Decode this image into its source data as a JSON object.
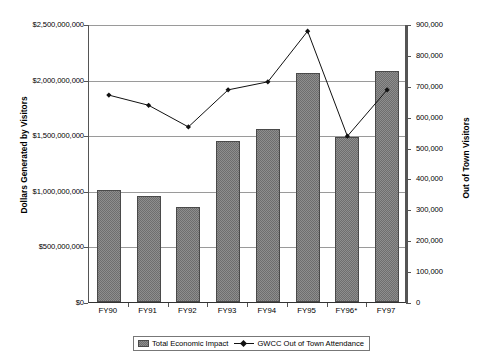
{
  "chart_data": {
    "type": "bar",
    "title": "",
    "categories": [
      "FY90",
      "FY91",
      "FY92",
      "FY93",
      "FY94",
      "FY95",
      "FY96*",
      "FY97"
    ],
    "xlabel": "",
    "series": [
      {
        "name": "Total Economic Impact",
        "type": "bar",
        "axis": "left",
        "values": [
          1010000000,
          955000000,
          850000000,
          1450000000,
          1560000000,
          2060000000,
          1480000000,
          2080000000
        ]
      },
      {
        "name": "GWCC Out of Town Attendance",
        "type": "line",
        "axis": "right",
        "values": [
          673000,
          640000,
          570000,
          690000,
          716000,
          880000,
          540000,
          690000
        ]
      }
    ],
    "left_axis": {
      "label": "Dollars Generated by Visitors",
      "ylim": [
        0,
        2500000000
      ],
      "tick_step": 500000000,
      "ticks": [
        "$0",
        "$500,000,000",
        "$1,000,000,000",
        "$1,500,000,000",
        "$2,000,000,000",
        "$2,500,000,000"
      ],
      "tick_values": [
        0,
        500000000,
        1000000000,
        1500000000,
        2000000000,
        2500000000
      ]
    },
    "right_axis": {
      "label": "Out of Town Visitors",
      "ylim": [
        0,
        900000
      ],
      "tick_step": 100000,
      "ticks": [
        "0",
        "100,000",
        "200,000",
        "300,000",
        "400,000",
        "500,000",
        "600,000",
        "700,000",
        "800,000",
        "900,000"
      ],
      "tick_values": [
        0,
        100000,
        200000,
        300000,
        400000,
        500000,
        600000,
        700000,
        800000,
        900000
      ]
    },
    "grid": true,
    "legend_position": "bottom",
    "legend": [
      "Total Economic Impact",
      "GWCC Out of Town Attendance"
    ],
    "colors": {
      "bar_fill": "#8e8e8e",
      "bar_border": "#4a4a4a",
      "line": "#111111",
      "grid": "#9a9a9a",
      "axis": "#555555",
      "background": "#ffffff"
    }
  }
}
